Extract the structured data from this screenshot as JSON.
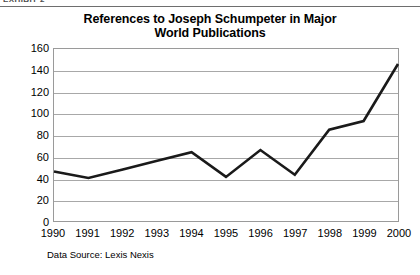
{
  "exhibit": {
    "label": "EXHIBIT 2"
  },
  "chart_data": {
    "type": "line",
    "title": "References to Joseph Schumpeter in Major World Publications",
    "title_line1": "References to Joseph Schumpeter in Major",
    "title_line2": "World Publications",
    "xlabel": "",
    "ylabel": "",
    "source_note": "Data Source: Lexis Nexis",
    "categories": [
      "1990",
      "1991",
      "1992",
      "1993",
      "1994",
      "1995",
      "1996",
      "1997",
      "1998",
      "1999",
      "2000"
    ],
    "values": [
      46,
      40,
      48,
      56,
      64,
      41,
      66,
      43,
      85,
      93,
      146
    ],
    "series": [
      {
        "name": "References to Joseph Schumpeter",
        "values": [
          46,
          40,
          48,
          56,
          64,
          41,
          66,
          43,
          85,
          93,
          146
        ],
        "color": "#1a1a1a"
      }
    ],
    "ylim": [
      0,
      160
    ],
    "ytick_step": 20,
    "yticks": [
      160,
      140,
      120,
      100,
      80,
      60,
      40,
      20,
      0
    ],
    "ytick_labels": [
      "160",
      "140",
      "120",
      "100",
      "80",
      "60",
      "40",
      "20",
      "0"
    ],
    "grid": true,
    "grid_axis": "y",
    "legend": false,
    "legend_position": "none",
    "markers": false,
    "line_width": 2.6,
    "colors": {
      "line": "#1a1a1a",
      "grid": "#a8a8a8",
      "axis": "#9a9a9a",
      "text": "#000000",
      "background": "#ffffff"
    }
  }
}
